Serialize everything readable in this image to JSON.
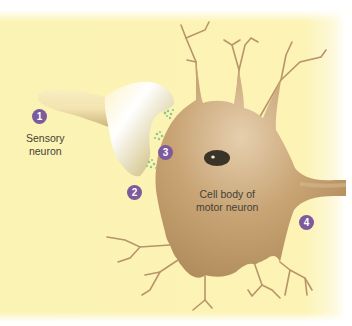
{
  "diagram": {
    "colors": {
      "background": "#fcf3b5",
      "motor_neuron": "#c19a6b",
      "motor_neuron_dark": "#a8825a",
      "nucleus": "#3a3328",
      "sensory_terminal_light": "#ffffff",
      "sensory_terminal_dark": "#8a7a46",
      "neurotransmitter": "#8cc98a",
      "badge": "#7c5a9c",
      "label_text": "#444236"
    },
    "callouts": [
      {
        "number": "1",
        "target": "sensory-neuron"
      },
      {
        "number": "2",
        "target": "axon-terminal"
      },
      {
        "number": "3",
        "target": "synaptic-cleft-neurotransmitters"
      },
      {
        "number": "4",
        "target": "motor-neuron-axon"
      }
    ],
    "labels": {
      "sensory_neuron": {
        "line1": "Sensory",
        "line2": "neuron"
      },
      "cell_body": {
        "line1": "Cell body of",
        "line2": "motor neuron"
      }
    }
  }
}
